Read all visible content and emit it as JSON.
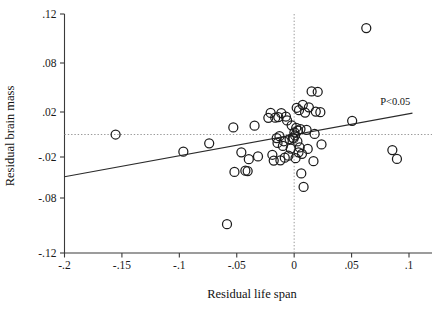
{
  "chart_data": {
    "type": "scatter",
    "title": "",
    "xlabel": "Residual life span",
    "ylabel": "Residual brain mass",
    "xlim": [
      -0.2,
      0.1
    ],
    "ylim": [
      -0.12,
      0.12
    ],
    "grid": false,
    "legend": null,
    "xticks": [
      -0.2,
      -0.15,
      -0.1,
      -0.05,
      0,
      0.05,
      0.1
    ],
    "xticklabels": [
      "-.2",
      "-.15",
      "-.1",
      "-.05",
      "0",
      ".05",
      ".1"
    ],
    "yticks": [
      0.12,
      0.08,
      0.02,
      -0.02,
      -0.08,
      -0.12
    ],
    "yticklabels": [
      ".12",
      ".08",
      ".02",
      "-.02",
      "-.08",
      "-.12"
    ],
    "annotations": [
      {
        "text": "P<0.05",
        "x": 0.088,
        "y": 0.028
      }
    ],
    "reference_lines": [
      {
        "orientation": "horizontal",
        "value": 0,
        "style": "dotted"
      },
      {
        "orientation": "vertical",
        "value": 0,
        "style": "dotted"
      }
    ],
    "trend_line": {
      "x": [
        -0.2,
        0.103
      ],
      "y": [
        -0.049,
        0.019
      ],
      "style": "solid",
      "significance": "P<0.05"
    },
    "marker": {
      "shape": "open-circle",
      "size": 9,
      "fill": "none",
      "edge": "#1c1c1c"
    },
    "points": [
      {
        "x": -0.1555,
        "y": 0.0
      },
      {
        "x": -0.0965,
        "y": -0.0153
      },
      {
        "x": -0.074,
        "y": -0.0078
      },
      {
        "x": -0.0585,
        "y": -0.099
      },
      {
        "x": -0.053,
        "y": 0.0063
      },
      {
        "x": -0.052,
        "y": -0.0418
      },
      {
        "x": -0.046,
        "y": -0.0158
      },
      {
        "x": -0.0425,
        "y": -0.04
      },
      {
        "x": -0.0405,
        "y": -0.0405
      },
      {
        "x": -0.0395,
        "y": -0.0232
      },
      {
        "x": -0.0345,
        "y": 0.0078
      },
      {
        "x": -0.0315,
        "y": -0.0195
      },
      {
        "x": -0.0225,
        "y": 0.0148
      },
      {
        "x": -0.0205,
        "y": 0.0192
      },
      {
        "x": -0.019,
        "y": -0.018
      },
      {
        "x": -0.0178,
        "y": -0.0252
      },
      {
        "x": -0.0165,
        "y": 0.015
      },
      {
        "x": -0.0152,
        "y": -0.0032
      },
      {
        "x": -0.0145,
        "y": -0.0075
      },
      {
        "x": -0.0138,
        "y": 0.0155
      },
      {
        "x": -0.0128,
        "y": -0.0015
      },
      {
        "x": -0.012,
        "y": -0.0248
      },
      {
        "x": -0.0112,
        "y": 0.019
      },
      {
        "x": -0.0098,
        "y": -0.0102
      },
      {
        "x": -0.009,
        "y": -0.006
      },
      {
        "x": -0.0082,
        "y": -0.021
      },
      {
        "x": -0.0072,
        "y": 0.016
      },
      {
        "x": -0.0062,
        "y": 0.0125
      },
      {
        "x": -0.005,
        "y": -0.0188
      },
      {
        "x": -0.004,
        "y": -0.004
      },
      {
        "x": -0.003,
        "y": -0.0125
      },
      {
        "x": -0.0022,
        "y": 0.0082
      },
      {
        "x": -0.0012,
        "y": -0.0028
      },
      {
        "x": -0.0005,
        "y": -0.0035
      },
      {
        "x": 0.0002,
        "y": 0.0018
      },
      {
        "x": 0.0008,
        "y": -0.0008
      },
      {
        "x": 0.0012,
        "y": -0.0218
      },
      {
        "x": 0.0018,
        "y": 0.006
      },
      {
        "x": 0.0022,
        "y": 0.0252
      },
      {
        "x": 0.0028,
        "y": -0.0062
      },
      {
        "x": 0.0032,
        "y": 0.0035
      },
      {
        "x": 0.0038,
        "y": -0.0158
      },
      {
        "x": 0.0042,
        "y": 0.0222
      },
      {
        "x": 0.0048,
        "y": -0.0115
      },
      {
        "x": 0.0055,
        "y": 0.0048
      },
      {
        "x": 0.0062,
        "y": -0.044
      },
      {
        "x": 0.0068,
        "y": -0.0172
      },
      {
        "x": 0.0075,
        "y": 0.0288
      },
      {
        "x": 0.0082,
        "y": -0.0638
      },
      {
        "x": 0.0095,
        "y": 0.0195
      },
      {
        "x": 0.0108,
        "y": 0.0042
      },
      {
        "x": 0.0118,
        "y": -0.0128
      },
      {
        "x": 0.0128,
        "y": 0.0258
      },
      {
        "x": 0.0152,
        "y": 0.0452
      },
      {
        "x": 0.0168,
        "y": -0.0262
      },
      {
        "x": 0.0178,
        "y": 0.0005
      },
      {
        "x": 0.0188,
        "y": 0.0205
      },
      {
        "x": 0.0205,
        "y": 0.0448
      },
      {
        "x": 0.0228,
        "y": 0.0198
      },
      {
        "x": 0.0238,
        "y": -0.0088
      },
      {
        "x": 0.0505,
        "y": 0.0122
      },
      {
        "x": 0.0628,
        "y": 0.1085
      },
      {
        "x": 0.0855,
        "y": -0.0138
      },
      {
        "x": 0.0895,
        "y": -0.0228
      }
    ]
  },
  "figure": {
    "caption": ""
  }
}
